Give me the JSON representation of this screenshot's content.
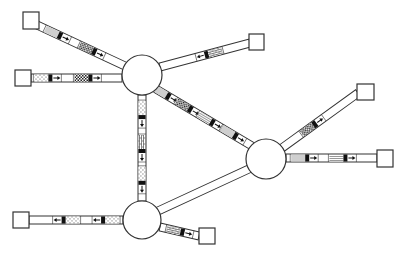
{
  "diagram": {
    "type": "network-topology",
    "colors": {
      "stroke": "#333333",
      "fill": "#ffffff",
      "header": "#111111",
      "gray": "#cfcfcf"
    },
    "switches": [
      {
        "id": "S1",
        "cx": 142,
        "cy": 75,
        "r": 20
      },
      {
        "id": "S2",
        "cx": 266,
        "cy": 159,
        "r": 20
      },
      {
        "id": "S3",
        "cx": 142,
        "cy": 220,
        "r": 19
      }
    ],
    "hosts": [
      {
        "id": "H1",
        "x": 23,
        "y": 12,
        "w": 16,
        "h": 17
      },
      {
        "id": "H2",
        "x": 15,
        "y": 70,
        "w": 16,
        "h": 16
      },
      {
        "id": "H3",
        "x": 249,
        "y": 34,
        "w": 15,
        "h": 16
      },
      {
        "id": "H4",
        "x": 357,
        "y": 84,
        "w": 17,
        "h": 16
      },
      {
        "id": "H5",
        "x": 377,
        "y": 150,
        "w": 16,
        "h": 17
      },
      {
        "id": "H6",
        "x": 13,
        "y": 212,
        "w": 16,
        "h": 16
      },
      {
        "id": "H7",
        "x": 199,
        "y": 228,
        "w": 16,
        "h": 16
      }
    ],
    "links": [
      {
        "id": "L1",
        "from": [
          37,
          25
        ],
        "to": [
          125,
          66
        ],
        "packets": [
          {
            "t": 0.23,
            "pattern": "gray",
            "dir": "forward"
          },
          {
            "t": 0.62,
            "pattern": "checker",
            "dir": "forward"
          }
        ]
      },
      {
        "id": "L2",
        "from": [
          31,
          78
        ],
        "to": [
          122,
          78
        ],
        "packets": [
          {
            "t": 0.18,
            "pattern": "dots",
            "dir": "forward"
          },
          {
            "t": 0.62,
            "pattern": "checker",
            "dir": "forward"
          }
        ]
      },
      {
        "id": "L3",
        "from": [
          160,
          67
        ],
        "to": [
          250,
          43
        ],
        "packets": [
          {
            "t": 0.55,
            "pattern": "brick",
            "dir": "backward"
          }
        ]
      },
      {
        "id": "L4",
        "from": [
          156,
          89
        ],
        "to": [
          252,
          146
        ],
        "packets": [
          {
            "t": 0.1,
            "pattern": "gray",
            "dir": "forward"
          },
          {
            "t": 0.33,
            "pattern": "checker",
            "dir": "forward"
          },
          {
            "t": 0.56,
            "pattern": "zigzag",
            "dir": "forward"
          },
          {
            "t": 0.8,
            "pattern": "gray",
            "dir": "forward"
          }
        ]
      },
      {
        "id": "L5",
        "from": [
          282,
          148
        ],
        "to": [
          358,
          93
        ],
        "packets": [
          {
            "t": 0.4,
            "pattern": "checker",
            "dir": "forward"
          }
        ]
      },
      {
        "id": "L6",
        "from": [
          286,
          158
        ],
        "to": [
          377,
          158
        ],
        "packets": [
          {
            "t": 0.2,
            "pattern": "gray",
            "dir": "forward"
          },
          {
            "t": 0.62,
            "pattern": "zigzag",
            "dir": "forward"
          }
        ]
      },
      {
        "id": "L7",
        "from": [
          142,
          95
        ],
        "to": [
          142,
          201
        ],
        "packets": [
          {
            "t": 0.18,
            "pattern": "dots",
            "dir": "forward"
          },
          {
            "t": 0.5,
            "pattern": "brick",
            "dir": "forward"
          },
          {
            "t": 0.8,
            "pattern": "dots",
            "dir": "forward"
          }
        ]
      },
      {
        "id": "L8",
        "from": [
          251,
          168
        ],
        "to": [
          158,
          211
        ],
        "packets": []
      },
      {
        "id": "L9",
        "from": [
          123,
          220
        ],
        "to": [
          29,
          220
        ],
        "packets": [
          {
            "t": 0.18,
            "pattern": "dots",
            "dir": "forward"
          },
          {
            "t": 0.6,
            "pattern": "dots",
            "dir": "forward"
          }
        ]
      },
      {
        "id": "L10",
        "from": [
          160,
          227
        ],
        "to": [
          199,
          236
        ],
        "packets": [
          {
            "t": 0.5,
            "pattern": "brick",
            "dir": "forward"
          }
        ]
      }
    ]
  }
}
